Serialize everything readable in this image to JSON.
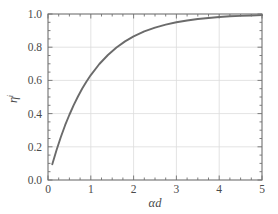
{
  "chart_data": {
    "type": "line",
    "title": "",
    "subtitle": "",
    "xlabel": "αd",
    "xlabel_base": "αd",
    "ylabel": "η",
    "ylabel_base": "η",
    "ylabel_subscript": "i",
    "xlim": [
      0,
      5
    ],
    "ylim": [
      0.0,
      1.0
    ],
    "grid": true,
    "legend": "none",
    "xticks": [
      "0",
      "1",
      "2",
      "3",
      "4",
      "5"
    ],
    "xtick_values": [
      0,
      1,
      2,
      3,
      4,
      5
    ],
    "xminor_step": 0.25,
    "yticks": [
      "0.0",
      "0.2",
      "0.4",
      "0.6",
      "0.8",
      "1.0"
    ],
    "ytick_values": [
      0.0,
      0.2,
      0.4,
      0.6,
      0.8,
      1.0
    ],
    "yminor_step": 0.05,
    "series": [
      {
        "name": "eta",
        "x": [
          0.1,
          0.2,
          0.3,
          0.4,
          0.5,
          0.6,
          0.7,
          0.8,
          0.9,
          1.0,
          1.2,
          1.4,
          1.6,
          1.8,
          2.0,
          2.25,
          2.5,
          2.75,
          3.0,
          3.25,
          3.5,
          3.75,
          4.0,
          4.25,
          4.5,
          4.75,
          5.0
        ],
        "values": [
          0.095,
          0.181,
          0.259,
          0.33,
          0.393,
          0.451,
          0.503,
          0.551,
          0.593,
          0.632,
          0.699,
          0.753,
          0.798,
          0.835,
          0.865,
          0.895,
          0.918,
          0.936,
          0.95,
          0.961,
          0.97,
          0.976,
          0.982,
          0.986,
          0.989,
          0.991,
          0.993
        ]
      }
    ],
    "colors": {
      "line": "#6b6b6b",
      "grid": "#dcdcdc",
      "axis": "#707070",
      "text": "#4a4a4a",
      "background": "#ffffff"
    },
    "line_width": 1.9
  }
}
